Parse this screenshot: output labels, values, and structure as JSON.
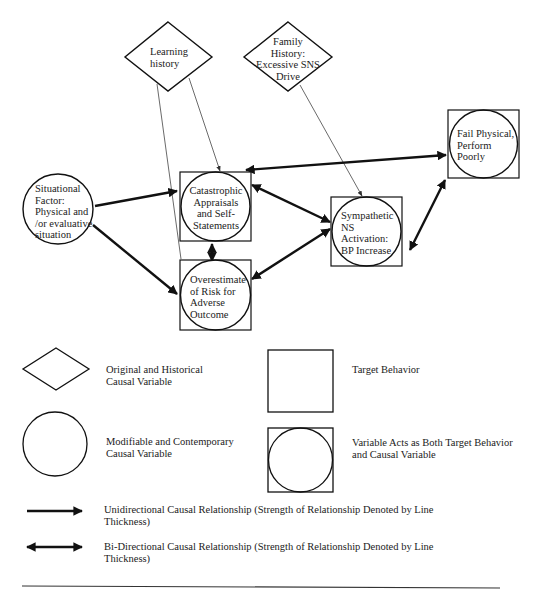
{
  "diagram": {
    "nodes": {
      "learning_history": {
        "type": "diamond",
        "lines": [
          "Learning",
          "history"
        ]
      },
      "family_history": {
        "type": "diamond",
        "lines": [
          "Family",
          "History:",
          "Excessive SNS",
          "Drive"
        ]
      },
      "situational_factor": {
        "type": "circle",
        "lines": [
          "Situational",
          "Factor:",
          "Physical and",
          "/or evaluative",
          "situation"
        ]
      },
      "catastrophic_appraisals": {
        "type": "circle-in-square",
        "lines": [
          "Catastrophic",
          "Appraisals",
          "and Self-",
          "Statements"
        ]
      },
      "overestimate_risk": {
        "type": "circle-in-square",
        "lines": [
          "Overestimate",
          "of Risk for",
          "Adverse",
          "Outcome"
        ]
      },
      "sympathetic_ns": {
        "type": "circle-in-square",
        "lines": [
          "Sympathetic",
          "NS",
          "Activation:",
          "BP Increase"
        ]
      },
      "fail_physical": {
        "type": "circle-in-square",
        "lines": [
          "Fail Physical,",
          "Perform",
          "Poorly"
        ]
      }
    },
    "edges": [
      {
        "from": "learning_history",
        "to": "catastrophic_appraisals",
        "direction": "uni",
        "strength": "weak"
      },
      {
        "from": "learning_history",
        "to": "overestimate_risk",
        "direction": "uni",
        "strength": "weak"
      },
      {
        "from": "family_history",
        "to": "sympathetic_ns",
        "direction": "uni",
        "strength": "weak"
      },
      {
        "from": "situational_factor",
        "to": "catastrophic_appraisals",
        "direction": "uni",
        "strength": "strong"
      },
      {
        "from": "situational_factor",
        "to": "overestimate_risk",
        "direction": "uni",
        "strength": "strong"
      },
      {
        "from": "catastrophic_appraisals",
        "to": "overestimate_risk",
        "direction": "bi",
        "strength": "strong"
      },
      {
        "from": "catastrophic_appraisals",
        "to": "sympathetic_ns",
        "direction": "bi",
        "strength": "strong"
      },
      {
        "from": "overestimate_risk",
        "to": "sympathetic_ns",
        "direction": "bi",
        "strength": "strong"
      },
      {
        "from": "catastrophic_appraisals",
        "to": "fail_physical",
        "direction": "bi",
        "strength": "strong"
      },
      {
        "from": "sympathetic_ns",
        "to": "fail_physical",
        "direction": "bi",
        "strength": "strong"
      }
    ]
  },
  "legend": {
    "diamond": [
      "Original and Historical",
      "Causal Variable"
    ],
    "square": [
      "Target Behavior"
    ],
    "circle": [
      "Modifiable and Contemporary",
      "Causal Variable"
    ],
    "circle_in_square": [
      "Variable Acts as Both Target Behavior",
      "and Causal Variable"
    ],
    "unidirectional": [
      "Unidirectional Causal Relationship (Strength of Relationship Denoted by Line",
      "Thickness)"
    ],
    "bidirectional": [
      "Bi-Directional Causal Relationship (Strength of Relationship Denoted by Line",
      "Thickness)"
    ]
  }
}
